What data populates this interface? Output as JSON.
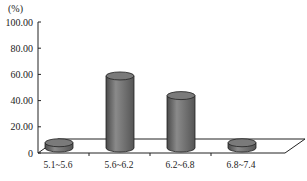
{
  "chart_data": {
    "type": "bar",
    "style": "3d-cylinder",
    "title": "",
    "ylabel": "(%)",
    "xlabel": "",
    "categories": [
      "5.1~5.6",
      "5.6~6.2",
      "6.2~6.8",
      "6.8~7.4"
    ],
    "values": [
      4,
      55,
      40,
      4
    ],
    "ylim": [
      0,
      100
    ],
    "yticks": [
      "0",
      "20.00",
      "40.00",
      "60.00",
      "80.00",
      "100.00"
    ],
    "grid": false,
    "legend": null,
    "bar_color": "#6f6f6f"
  }
}
